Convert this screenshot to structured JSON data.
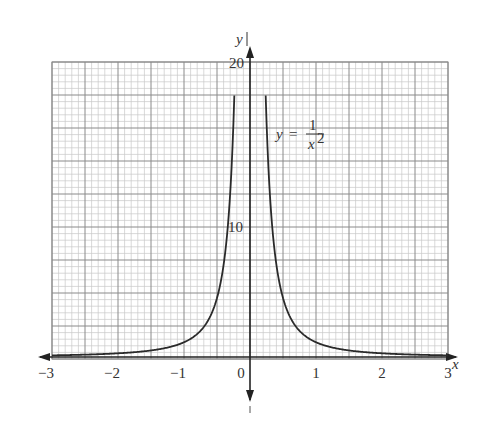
{
  "chart_data": {
    "type": "line",
    "title": "",
    "xlabel": "x",
    "ylabel": "y",
    "equation_label": {
      "lhs": "y",
      "eq": "=",
      "numerator": "1",
      "denominator": "x",
      "exponent": "2"
    },
    "xlim": [
      -3,
      3
    ],
    "ylim": [
      0,
      20
    ],
    "x_ticks": [
      "−3",
      "−2",
      "−1",
      "0",
      "1",
      "2",
      "3"
    ],
    "x_tick_values": [
      -3,
      -2,
      -1,
      0,
      1,
      2,
      3
    ],
    "y_ticks": [
      "10",
      "20"
    ],
    "y_tick_values": [
      10,
      20
    ],
    "grid": true,
    "legend": "none",
    "series": [
      {
        "name": "y = 1/x^2",
        "function": "1/x^2",
        "x": [
          -3,
          -2.5,
          -2,
          -1.5,
          -1,
          -0.8,
          -0.6,
          -0.5,
          -0.4,
          -0.3,
          -0.25,
          -0.224,
          0.224,
          0.25,
          0.3,
          0.4,
          0.5,
          0.6,
          0.8,
          1,
          1.5,
          2,
          2.5,
          3
        ],
        "y": [
          0.11,
          0.16,
          0.25,
          0.44,
          1,
          1.56,
          2.78,
          4,
          6.25,
          11.11,
          16,
          20,
          20,
          16,
          11.11,
          6.25,
          4,
          2.78,
          1.56,
          1,
          0.44,
          0.25,
          0.16,
          0.11
        ]
      }
    ]
  },
  "colors": {
    "grid_minor": "#c8c8c8",
    "grid_major": "#8a8a8a",
    "curve": "#2a2a2a",
    "axis": "#222222",
    "text": "#333333"
  }
}
